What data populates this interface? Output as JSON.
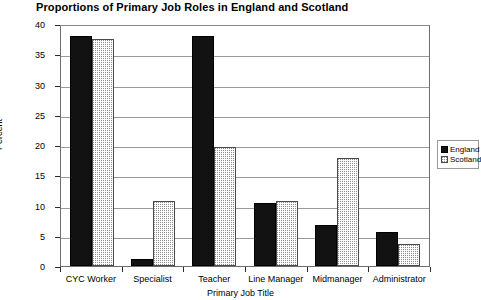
{
  "chart_data": {
    "type": "bar",
    "title": "Proportions of Primary Job Roles in England and Scotland",
    "xlabel": "Primary Job Title",
    "ylabel": "Percent",
    "ylim": [
      0,
      40
    ],
    "yticks": [
      0,
      5,
      10,
      15,
      20,
      25,
      30,
      35,
      40
    ],
    "grid": true,
    "legend_position": "right",
    "categories": [
      "CYC Worker",
      "Specialist",
      "Teacher",
      "Line Manager",
      "Midmanager",
      "Administrator"
    ],
    "series": [
      {
        "name": "England",
        "color": "#121212",
        "values": [
          38.0,
          1.2,
          38.0,
          10.4,
          6.8,
          5.7
        ]
      },
      {
        "name": "Scotland",
        "color": "#d9d9d9",
        "values": [
          37.5,
          10.7,
          19.6,
          10.7,
          17.9,
          3.6
        ]
      }
    ]
  }
}
